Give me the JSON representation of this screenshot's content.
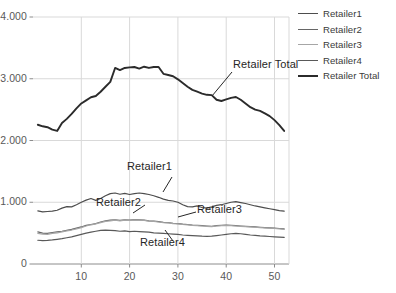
{
  "chart_data": {
    "type": "line",
    "title": "",
    "xlabel": "",
    "ylabel": "",
    "xlim": [
      0,
      53
    ],
    "ylim": [
      0,
      4000
    ],
    "grid": true,
    "grid_axes": "both",
    "legend_position": "right",
    "y_ticks": [
      0,
      1000,
      2000,
      3000,
      4000
    ],
    "y_ticklabels": [
      "0",
      "1.000",
      "2.000",
      "3.000",
      "4.000"
    ],
    "x_ticks": [
      10,
      20,
      30,
      40,
      50
    ],
    "x_ticklabels": [
      "10",
      "20",
      "30",
      "40",
      "50"
    ],
    "x": [
      1,
      2,
      3,
      4,
      5,
      6,
      7,
      8,
      9,
      10,
      11,
      12,
      13,
      14,
      15,
      16,
      17,
      18,
      19,
      20,
      21,
      22,
      23,
      24,
      25,
      26,
      27,
      28,
      29,
      30,
      31,
      32,
      33,
      34,
      35,
      36,
      37,
      38,
      39,
      40,
      41,
      42,
      43,
      44,
      45,
      46,
      47,
      48,
      49,
      50,
      51,
      52
    ],
    "series": [
      {
        "name": "Retailer1",
        "color": "#4d4d4d",
        "width": 1.2,
        "values": [
          860,
          845,
          850,
          855,
          870,
          905,
          930,
          925,
          960,
          1000,
          1035,
          1060,
          1030,
          1060,
          1105,
          1140,
          1150,
          1130,
          1145,
          1125,
          1140,
          1150,
          1140,
          1125,
          1105,
          1080,
          1050,
          1030,
          1020,
          1000,
          960,
          930,
          925,
          940,
          915,
          905,
          925,
          950,
          960,
          980,
          1000,
          1010,
          995,
          980,
          960,
          940,
          925,
          910,
          895,
          880,
          865,
          855
        ]
      },
      {
        "name": "Retailer2",
        "color": "#666666",
        "width": 1.2,
        "values": [
          520,
          500,
          495,
          510,
          520,
          530,
          545,
          560,
          580,
          600,
          625,
          640,
          655,
          680,
          700,
          710,
          715,
          705,
          715,
          710,
          720,
          715,
          710,
          700,
          695,
          685,
          675,
          670,
          660,
          655,
          645,
          640,
          630,
          625,
          620,
          615,
          610,
          620,
          625,
          630,
          625,
          620,
          615,
          610,
          605,
          600,
          595,
          590,
          585,
          580,
          575,
          570
        ]
      },
      {
        "name": "Retailer3",
        "color": "#a6a6a6",
        "width": 1.2,
        "values": [
          495,
          485,
          480,
          495,
          505,
          520,
          535,
          550,
          570,
          590,
          615,
          635,
          650,
          670,
          690,
          700,
          710,
          700,
          710,
          705,
          715,
          710,
          705,
          695,
          690,
          680,
          670,
          665,
          655,
          650,
          640,
          635,
          625,
          620,
          615,
          610,
          605,
          615,
          620,
          625,
          620,
          615,
          610,
          605,
          600,
          595,
          590,
          585,
          580,
          575,
          570,
          560
        ]
      },
      {
        "name": "Retailer4",
        "color": "#595959",
        "width": 1.2,
        "values": [
          385,
          380,
          382,
          390,
          400,
          410,
          425,
          440,
          460,
          480,
          500,
          515,
          530,
          545,
          550,
          545,
          540,
          530,
          535,
          525,
          530,
          525,
          520,
          515,
          505,
          500,
          495,
          490,
          485,
          480,
          470,
          465,
          460,
          455,
          450,
          448,
          450,
          460,
          470,
          480,
          490,
          495,
          490,
          480,
          470,
          462,
          455,
          450,
          445,
          440,
          435,
          430
        ]
      },
      {
        "name": "Retailer Total",
        "color": "#2b2b2b",
        "width": 1.9,
        "values": [
          2255,
          2230,
          2215,
          2175,
          2155,
          2285,
          2350,
          2430,
          2520,
          2600,
          2650,
          2700,
          2720,
          2790,
          2870,
          2950,
          3175,
          3140,
          3175,
          3185,
          3190,
          3165,
          3195,
          3175,
          3190,
          3190,
          3080,
          3060,
          3040,
          2990,
          2930,
          2870,
          2820,
          2790,
          2760,
          2740,
          2735,
          2660,
          2640,
          2665,
          2690,
          2705,
          2660,
          2600,
          2540,
          2500,
          2480,
          2440,
          2395,
          2330,
          2250,
          2155
        ]
      }
    ],
    "annotations": [
      {
        "text": "Retailer Total",
        "series": "Retailer Total"
      },
      {
        "text": "Retailer1",
        "series": "Retailer1"
      },
      {
        "text": "Retailer2",
        "series": "Retailer2"
      },
      {
        "text": "Retailer3",
        "series": "Retailer3"
      },
      {
        "text": "Retailer4",
        "series": "Retailer4"
      }
    ]
  },
  "legend": {
    "items": [
      {
        "label": "Retailer1"
      },
      {
        "label": "Retailer2"
      },
      {
        "label": "Retailer3"
      },
      {
        "label": "Retailer4"
      },
      {
        "label": "Retailer Total"
      }
    ]
  }
}
